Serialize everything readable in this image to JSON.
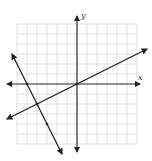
{
  "chart_data": {
    "type": "line",
    "title": "",
    "xlabel": "x",
    "ylabel": "y",
    "grid": true,
    "xlim": [
      -6,
      6
    ],
    "ylim": [
      -6,
      6
    ],
    "series": [
      {
        "name": "line-1",
        "equation": "y = 0.5x",
        "x": [
          -7,
          7
        ],
        "y": [
          -3.5,
          3.5
        ],
        "marked_points": [
          [
            0,
            0
          ],
          [
            -4,
            -2
          ]
        ]
      },
      {
        "name": "line-2",
        "equation": "y = -2x - 10",
        "x": [
          -6.5,
          -1.5
        ],
        "y": [
          3,
          -7
        ],
        "marked_points": [
          [
            -5,
            0
          ],
          [
            -4,
            -2
          ],
          [
            -3,
            -4
          ]
        ]
      }
    ]
  },
  "labels": {
    "x_axis": "x",
    "y_axis": "y"
  },
  "colors": {
    "grid": "#d9d9d9",
    "axis": "#333333",
    "line": "#222222",
    "background": "#ffffff"
  }
}
